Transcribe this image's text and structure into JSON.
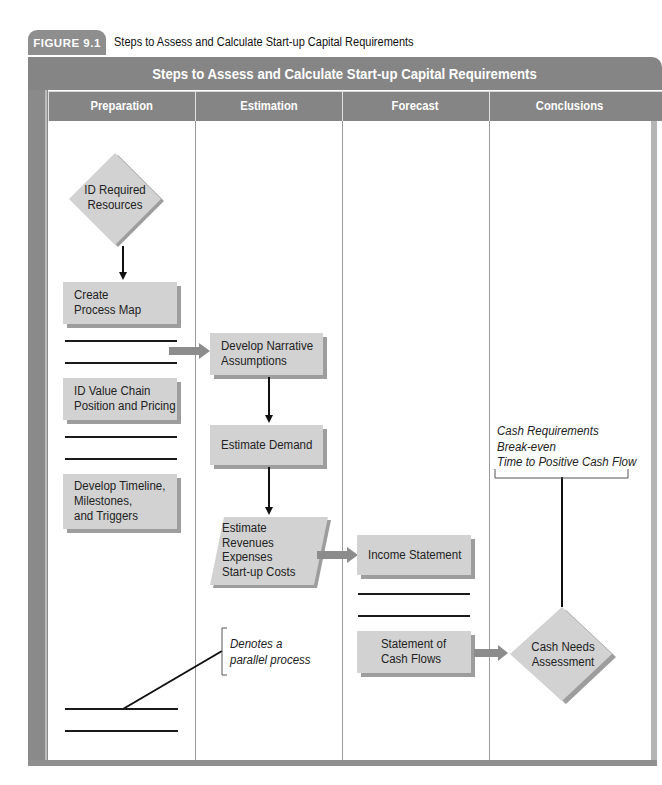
{
  "figure": {
    "label": "FIGURE 9.1",
    "caption": "Steps to Assess and Calculate Start-up Capital Requirements"
  },
  "diagram": {
    "title": "Steps to Assess and Calculate Start-up Capital Requirements",
    "lanes": [
      {
        "label": "Preparation"
      },
      {
        "label": "Estimation"
      },
      {
        "label": "Forecast"
      },
      {
        "label": "Conclusions"
      }
    ],
    "nodes": {
      "id_required_resources": {
        "lines": [
          "ID Required",
          "Resources"
        ],
        "shape": "diamond",
        "lane": "Preparation"
      },
      "create_process_map": {
        "lines": [
          "Create",
          "Process Map"
        ],
        "shape": "box",
        "lane": "Preparation"
      },
      "id_value_chain": {
        "lines": [
          "ID Value Chain",
          "Position and Pricing"
        ],
        "shape": "box",
        "lane": "Preparation"
      },
      "develop_timeline": {
        "lines": [
          "Develop Timeline,",
          "Milestones,",
          "and Triggers"
        ],
        "shape": "box",
        "lane": "Preparation"
      },
      "develop_narrative": {
        "lines": [
          "Develop Narrative",
          "Assumptions"
        ],
        "shape": "box",
        "lane": "Estimation"
      },
      "estimate_demand": {
        "lines": [
          "Estimate Demand"
        ],
        "shape": "box",
        "lane": "Estimation"
      },
      "estimate_revenues": {
        "lines": [
          "Estimate",
          "Revenues",
          "Expenses",
          "Start-up Costs"
        ],
        "shape": "parallelogram",
        "lane": "Estimation"
      },
      "income_statement": {
        "lines": [
          "Income Statement"
        ],
        "shape": "box",
        "lane": "Forecast"
      },
      "statement_cash_flows": {
        "lines": [
          "Statement of",
          "Cash Flows"
        ],
        "shape": "box",
        "lane": "Forecast"
      },
      "cash_needs_assessment": {
        "lines": [
          "Cash Needs",
          "Assessment"
        ],
        "shape": "diamond",
        "lane": "Conclusions"
      }
    },
    "annotations": {
      "outputs": [
        "Cash Requirements",
        "Break-even",
        "Time to Positive Cash Flow"
      ],
      "legend": [
        "Denotes a",
        "parallel process"
      ]
    },
    "edges": [
      {
        "from": "ID Required Resources",
        "to": "Create Process Map"
      },
      {
        "from": "Preparation parallel process",
        "to": "Develop Narrative Assumptions"
      },
      {
        "from": "Develop Narrative Assumptions",
        "to": "Estimate Demand"
      },
      {
        "from": "Estimate Demand",
        "to": "Estimate Revenues Expenses Start-up Costs"
      },
      {
        "from": "Estimate Revenues Expenses Start-up Costs",
        "to": "Income Statement"
      },
      {
        "from": "Statement of Cash Flows",
        "to": "Cash Needs Assessment"
      },
      {
        "from": "Cash Needs Assessment",
        "to": "Cash Requirements / Break-even / Time to Positive Cash Flow"
      }
    ],
    "colors": {
      "header_gray": "#858585",
      "node_fill": "#d2d2d2",
      "node_shadow": "#9d9d9d",
      "arrow_gray": "#8c8c8c"
    }
  }
}
